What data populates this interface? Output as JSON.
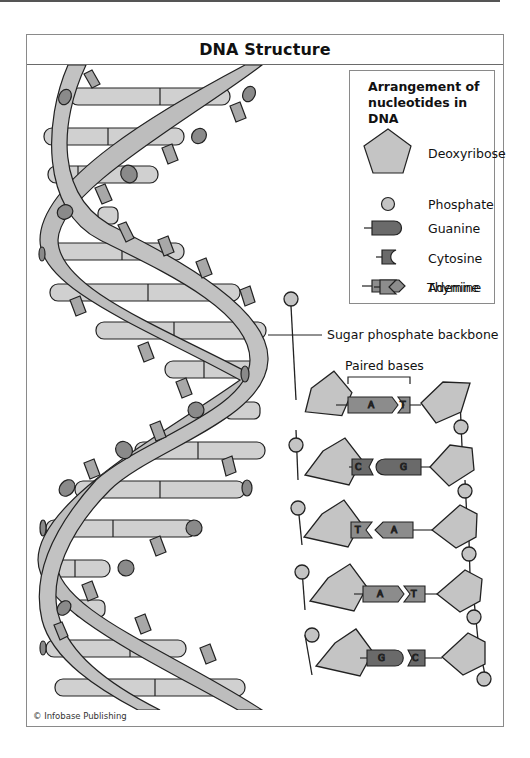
{
  "title": "DNA Structure",
  "legend": {
    "title_line1": "Arrangement of",
    "title_line2": "nucleotides in DNA",
    "items": [
      {
        "label": "Deoxyribose",
        "icon": "pentagon-icon"
      },
      {
        "label": "Phosphate",
        "icon": "circle-icon"
      },
      {
        "label": "Guanine",
        "icon": "guanine-rounded-block-icon"
      },
      {
        "label": "Cytosine",
        "icon": "cytosine-notched-block-icon"
      },
      {
        "label": "Adenine",
        "icon": "adenine-arrow-block-icon"
      },
      {
        "label": "Thymine",
        "icon": "thymine-v-notch-block-icon"
      }
    ]
  },
  "annotations": {
    "backbone": "Sugar phosphate backbone",
    "paired_bases": "Paired bases"
  },
  "base_pairs": [
    {
      "left": "A",
      "right": "T"
    },
    {
      "left": "C",
      "right": "G"
    },
    {
      "left": "T",
      "right": "A"
    },
    {
      "left": "A",
      "right": "T"
    },
    {
      "left": "G",
      "right": "C"
    }
  ],
  "colors": {
    "sugar": "#c4c4c4",
    "phosphate": "#c4c4c4",
    "guanine": "#6a6a6a",
    "cytosine": "#6a6a6a",
    "adenine": "#8c8c8c",
    "thymine": "#8c8c8c",
    "ribbon": "#bdbdbd",
    "rung": "#d0d0d0",
    "outline": "#222222"
  },
  "credit": "© Infobase Publishing"
}
